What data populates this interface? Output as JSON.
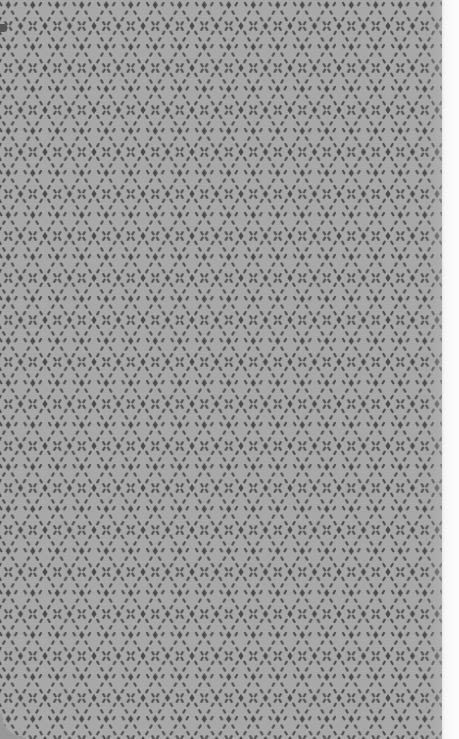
{
  "image": {
    "subject": "knit fabric texture",
    "description": "Grey textile with a repeating lattice of dark diamond dots linked by short diagonal dashes, with a light edge strip on the right",
    "colors": {
      "fabric_background": "#a8a8a8",
      "pattern_marks": "#4b4b4b",
      "edge_strip": "#fbfbfb",
      "corner_shadow": "#989898"
    },
    "pattern": {
      "type": "diamond-lattice",
      "cell_width_px": 24.5,
      "cell_height_px": 42,
      "motif": "diamond dot with X-shaped diagonal dashes"
    }
  }
}
